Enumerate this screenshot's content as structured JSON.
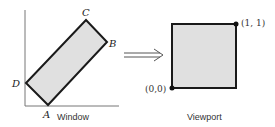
{
  "window_panel": {
    "caption": "Window",
    "vertices": {
      "A": "A",
      "B": "B",
      "C": "C",
      "D": "D"
    }
  },
  "viewport_panel": {
    "caption": "Viewport",
    "corner_bottom_left": "(0,0)",
    "corner_top_right": "(1, 1)"
  },
  "colors": {
    "fill": "#e0e0e0",
    "stroke": "#1a1a1a",
    "axis": "#555555"
  }
}
